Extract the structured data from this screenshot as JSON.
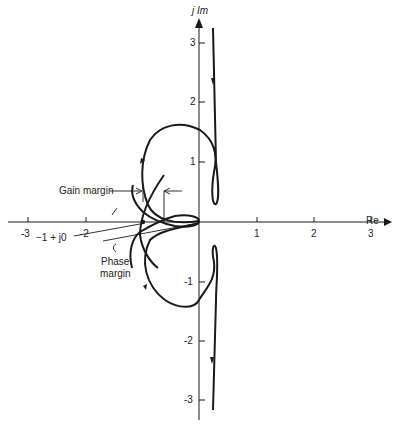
{
  "diagram": {
    "type": "nyquist_plot",
    "axes": {
      "x_label": "Re",
      "y_label": "j Im",
      "x_ticks": [
        "-3",
        "-2",
        "1",
        "2",
        "3"
      ],
      "y_ticks": [
        "3",
        "2",
        "1",
        "-1",
        "-2",
        "-3"
      ]
    },
    "annotations": {
      "gain_margin": "Gain margin",
      "critical_point": "−1 + j0",
      "phase_margin_line1": "Phase",
      "phase_margin_line2": "margin"
    },
    "colors": {
      "ink": "#1a1a1a",
      "background": "#ffffff"
    }
  }
}
